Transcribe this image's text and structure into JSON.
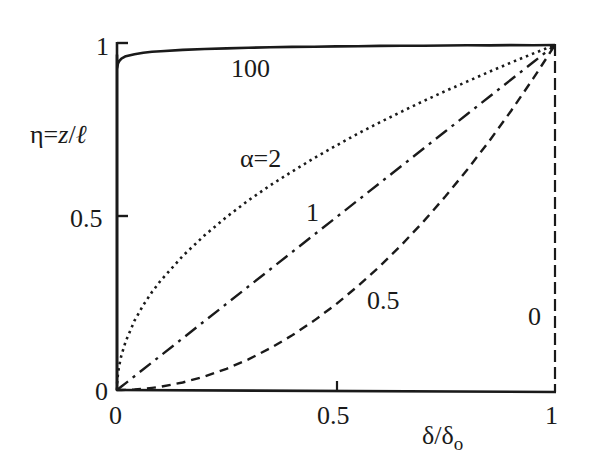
{
  "chart_data": {
    "type": "line",
    "title": "",
    "xlabel": "δ/δo",
    "ylabel": "η=z/ℓ",
    "xlim": [
      0,
      1
    ],
    "ylim": [
      0,
      1
    ],
    "grid": false,
    "legend": "inline curve labels",
    "x_ticks": [
      {
        "value": 0,
        "label": "0"
      },
      {
        "value": 0.5,
        "label": "0.5"
      },
      {
        "value": 1,
        "label": "1"
      }
    ],
    "y_ticks": [
      {
        "value": 0,
        "label": "0"
      },
      {
        "value": 0.5,
        "label": "0.5"
      },
      {
        "value": 1,
        "label": "1"
      }
    ],
    "relation": "η = (δ/δo)^(1/α)",
    "x": [
      0,
      0.0005,
      0.002,
      0.005,
      0.01,
      0.02,
      0.04,
      0.06,
      0.08,
      0.1,
      0.15,
      0.2,
      0.25,
      0.3,
      0.35,
      0.4,
      0.45,
      0.5,
      0.55,
      0.6,
      0.65,
      0.7,
      0.75,
      0.8,
      0.85,
      0.9,
      0.95,
      1
    ],
    "series": [
      {
        "name": "α=100",
        "label": "100",
        "alpha": 100,
        "style": "solid",
        "values": [
          0,
          0.927,
          0.94,
          0.948,
          0.955,
          0.962,
          0.968,
          0.972,
          0.975,
          0.977,
          0.981,
          0.984,
          0.986,
          0.988,
          0.99,
          0.991,
          0.992,
          0.993,
          0.994,
          0.995,
          0.996,
          0.996,
          0.997,
          0.998,
          0.998,
          0.999,
          0.999,
          1
        ]
      },
      {
        "name": "α=2",
        "label": "α=2",
        "alpha": 2,
        "style": "dotted",
        "values": [
          0,
          0.022,
          0.045,
          0.071,
          0.1,
          0.141,
          0.2,
          0.245,
          0.283,
          0.316,
          0.387,
          0.447,
          0.5,
          0.548,
          0.592,
          0.632,
          0.671,
          0.707,
          0.742,
          0.775,
          0.806,
          0.837,
          0.866,
          0.894,
          0.922,
          0.949,
          0.975,
          1
        ]
      },
      {
        "name": "α=1",
        "label": "1",
        "alpha": 1,
        "style": "dash-dot",
        "values": [
          0,
          0.0005,
          0.002,
          0.005,
          0.01,
          0.02,
          0.04,
          0.06,
          0.08,
          0.1,
          0.15,
          0.2,
          0.25,
          0.3,
          0.35,
          0.4,
          0.45,
          0.5,
          0.55,
          0.6,
          0.65,
          0.7,
          0.75,
          0.8,
          0.85,
          0.9,
          0.95,
          1
        ]
      },
      {
        "name": "α=0.5",
        "label": "0.5",
        "alpha": 0.5,
        "style": "dashed",
        "values": [
          0,
          0,
          0,
          0,
          0.0001,
          0.0004,
          0.0016,
          0.0036,
          0.0064,
          0.01,
          0.0225,
          0.04,
          0.0625,
          0.09,
          0.1225,
          0.16,
          0.2025,
          0.25,
          0.3025,
          0.36,
          0.4225,
          0.49,
          0.5625,
          0.64,
          0.7225,
          0.81,
          0.9025,
          1
        ]
      },
      {
        "name": "α=0",
        "label": "0",
        "alpha": 0,
        "style": "long-dash",
        "note": "vertical line at δ/δo = 1 from η=0 to η=1",
        "points": [
          [
            1,
            0
          ],
          [
            1,
            1
          ]
        ]
      }
    ],
    "annotations": [
      {
        "text": "100",
        "near_x": 0.3,
        "near_y": 0.95
      },
      {
        "text": "α=2",
        "near_x": 0.33,
        "near_y": 0.66
      },
      {
        "text": "1",
        "near_x": 0.44,
        "near_y": 0.5
      },
      {
        "text": "0.5",
        "near_x": 0.57,
        "near_y": 0.26
      },
      {
        "text": "0",
        "near_x": 0.95,
        "near_y": 0.2
      }
    ]
  },
  "labels": {
    "ylabel_eta": "η=",
    "ylabel_z": "z",
    "ylabel_slash": "/",
    "ylabel_ell": "ℓ",
    "xlabel_delta": "δ/δ",
    "xlabel_sub": "o",
    "ytick_1": "1",
    "ytick_05": "0.5",
    "ytick_0": "0",
    "xtick_0": "0",
    "xtick_05": "0.5",
    "xtick_1": "1",
    "curve_100": "100",
    "curve_2": "α=2",
    "curve_1": "1",
    "curve_05": "0.5",
    "curve_0": "0"
  },
  "colors": {
    "ink": "#1a1a1a",
    "background": "#ffffff"
  }
}
